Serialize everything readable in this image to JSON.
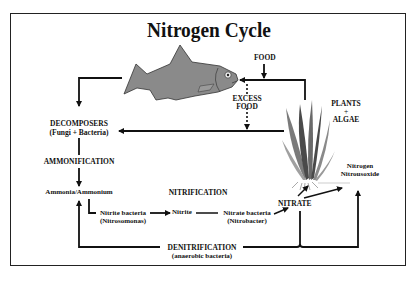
{
  "title": "Nitrogen Cycle",
  "nodes": {
    "food": "FOOD",
    "excess_food_line1": "EXCESS",
    "excess_food_line2": "FOOD",
    "plants_line1": "PLANTS",
    "plants_line2": "+",
    "plants_line3": "ALGAE",
    "decomposers_line1": "DECOMPOSERS",
    "decomposers_line2": "(Fungi + Bacteria)",
    "ammonification": "AMMONIFICATION",
    "ammonia": "Ammonia/Ammonium",
    "nitrification": "NITRIFICATION",
    "nitrite_bacteria_line1": "Nitrite bacteria",
    "nitrite_bacteria_line2": "(Nitrosomonas)",
    "nitrite": "Nitrite",
    "nitrate_bacteria_line1": "Nitrate bacteria",
    "nitrate_bacteria_line2": "(Nitrobacter)",
    "nitrate": "NITRATE",
    "nitrogen_line1": "Nitrogen",
    "nitrogen_line2": "Nitrousoxide",
    "denitrification_line1": "DENITRIFICATION",
    "denitrification_line2": "(anaerobic bacteria)"
  },
  "colors": {
    "fish_fill": "#8a8a8a",
    "fish_stroke": "#333333",
    "plant_dark": "#4a4a4a",
    "plant_mid": "#7a7a7a",
    "plant_light": "#a0a0a0",
    "line": "#111111"
  },
  "icons": {
    "fish": "fish-illustration",
    "plant": "aquatic-plant-illustration"
  }
}
